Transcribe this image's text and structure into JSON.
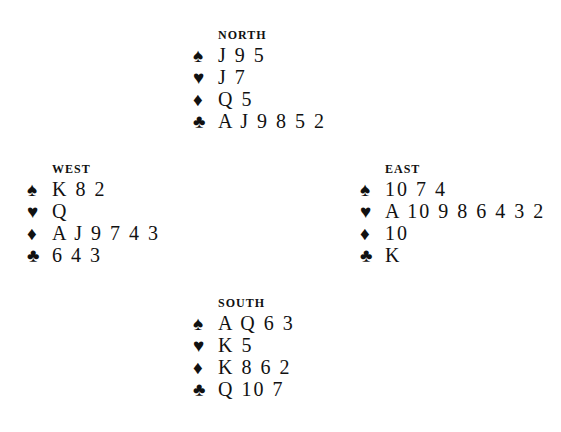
{
  "hands": {
    "north": {
      "label": "NORTH",
      "suits": [
        {
          "symbol": "♠",
          "name": "spades",
          "cards": "J 9 5"
        },
        {
          "symbol": "♥",
          "name": "hearts",
          "cards": "J 7"
        },
        {
          "symbol": "♦",
          "name": "diamonds",
          "cards": "Q 5"
        },
        {
          "symbol": "♣",
          "name": "clubs",
          "cards": "A J 9 8 5 2"
        }
      ]
    },
    "west": {
      "label": "WEST",
      "suits": [
        {
          "symbol": "♠",
          "name": "spades",
          "cards": "K 8 2"
        },
        {
          "symbol": "♥",
          "name": "hearts",
          "cards": "Q"
        },
        {
          "symbol": "♦",
          "name": "diamonds",
          "cards": "A J 9 7 4 3"
        },
        {
          "symbol": "♣",
          "name": "clubs",
          "cards": "6 4 3"
        }
      ]
    },
    "east": {
      "label": "EAST",
      "suits": [
        {
          "symbol": "♠",
          "name": "spades",
          "cards": "10 7 4"
        },
        {
          "symbol": "♥",
          "name": "hearts",
          "cards": "A 10 9 8 6 4 3 2"
        },
        {
          "symbol": "♦",
          "name": "diamonds",
          "cards": "10"
        },
        {
          "symbol": "♣",
          "name": "clubs",
          "cards": "K"
        }
      ]
    },
    "south": {
      "label": "SOUTH",
      "suits": [
        {
          "symbol": "♠",
          "name": "spades",
          "cards": "A Q 6 3"
        },
        {
          "symbol": "♥",
          "name": "hearts",
          "cards": "K 5"
        },
        {
          "symbol": "♦",
          "name": "diamonds",
          "cards": "K 8 6 2"
        },
        {
          "symbol": "♣",
          "name": "clubs",
          "cards": "Q 10 7"
        }
      ]
    }
  }
}
